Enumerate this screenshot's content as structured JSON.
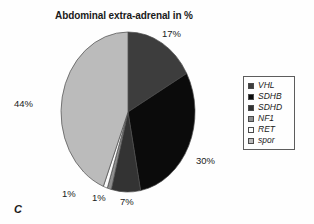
{
  "panel": {
    "letter": "C"
  },
  "chart_data": {
    "type": "pie",
    "title": "Abdominal extra-adrenal in %",
    "xlabel": "",
    "ylabel": "",
    "units": "%",
    "start_angle_deg": 0,
    "direction": "clockwise",
    "legend_position": "right",
    "grid": false,
    "categories": [
      "VHL",
      "SDHB",
      "SDHD",
      "NF1",
      "RET",
      "spor"
    ],
    "values": [
      17,
      30,
      7,
      1,
      1,
      44
    ],
    "labels": [
      "17%",
      "30%",
      "7%",
      "1%",
      "1%",
      "44%"
    ],
    "colors": [
      "#3d3d3d",
      "#0b0b0b",
      "#333333",
      "#8f8f8f",
      "#fbfbfb",
      "#bbbbbb"
    ],
    "slices": [
      {
        "name": "VHL",
        "value": 17,
        "label": "17%",
        "color": "#3d3d3d"
      },
      {
        "name": "SDHB",
        "value": 30,
        "label": "30%",
        "color": "#0b0b0b"
      },
      {
        "name": "SDHD",
        "value": 7,
        "label": "7%",
        "color": "#333333"
      },
      {
        "name": "NF1",
        "value": 1,
        "label": "1%",
        "color": "#8f8f8f"
      },
      {
        "name": "RET",
        "value": 1,
        "label": "1%",
        "color": "#fbfbfb"
      },
      {
        "name": "spor",
        "value": 44,
        "label": "44%",
        "color": "#bbbbbb"
      }
    ]
  },
  "legend": {
    "items": [
      {
        "label": "VHL",
        "color": "#3d3d3d"
      },
      {
        "label": "SDHB",
        "color": "#0b0b0b"
      },
      {
        "label": "SDHD",
        "color": "#333333"
      },
      {
        "label": "NF1",
        "color": "#8f8f8f"
      },
      {
        "label": "RET",
        "color": "#fbfbfb"
      },
      {
        "label": "spor",
        "color": "#bbbbbb"
      }
    ]
  }
}
